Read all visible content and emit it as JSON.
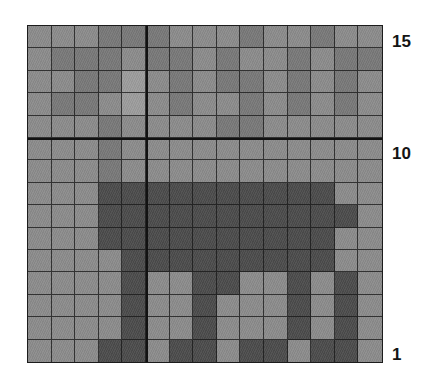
{
  "figure": {
    "caption": "",
    "background_color": "#ffffff"
  },
  "axis": {
    "y_ticks": [
      {
        "name": "ytick-15",
        "label": "15"
      },
      {
        "name": "ytick-10",
        "label": "10"
      },
      {
        "name": "ytick-1",
        "label": "1"
      }
    ]
  },
  "palette": {
    "light": "#9a9a9a",
    "mid": "#8a8a8a",
    "dark_mid": "#767676",
    "dark": "#4a4a4a",
    "gridline": "#191919",
    "border": "#1c1c1c",
    "tick_text": "#141414"
  },
  "chart_data": {
    "type": "heatmap",
    "title": "",
    "xlabel": "",
    "ylabel": "",
    "grid": true,
    "legend_position": "none",
    "rows": 15,
    "cols": 15,
    "xlim": [
      1,
      15
    ],
    "ylim": [
      1,
      15
    ],
    "x_tick_labels": [],
    "y_tick_labels": [
      "1",
      "10",
      "15"
    ],
    "y_tick_positions": [
      1,
      10,
      15
    ],
    "major_gridlines_every": 5,
    "value_levels": {
      "0": {
        "name": "light",
        "color": "#9c9c9c",
        "description": "background light gray"
      },
      "1": {
        "name": "mid",
        "color": "#8b8b8b",
        "description": "mid gray"
      },
      "2": {
        "name": "dark_mid",
        "color": "#787878",
        "description": "darker gray texture"
      },
      "3": {
        "name": "dark",
        "color": "#4b4b4b",
        "description": "object / animal silhouette"
      }
    },
    "comment": "Low-resolution 15x15 pixelated grayscale image of a quadruped animal (horse/cow) silhouette against a textured background. Rows listed top (row index 0 = y=15) to bottom (row index 14 = y=1). Each number is a value level key.",
    "values": [
      [
        1,
        1,
        1,
        2,
        2,
        2,
        1,
        1,
        1,
        2,
        1,
        1,
        2,
        1,
        1
      ],
      [
        1,
        2,
        2,
        2,
        1,
        2,
        2,
        1,
        2,
        1,
        1,
        2,
        1,
        2,
        2
      ],
      [
        1,
        1,
        2,
        2,
        0,
        1,
        2,
        1,
        2,
        2,
        1,
        2,
        1,
        2,
        1
      ],
      [
        1,
        2,
        2,
        1,
        0,
        1,
        2,
        1,
        1,
        2,
        1,
        2,
        1,
        2,
        1
      ],
      [
        1,
        1,
        1,
        2,
        1,
        1,
        1,
        1,
        2,
        2,
        1,
        1,
        1,
        1,
        1
      ],
      [
        1,
        1,
        1,
        2,
        1,
        1,
        1,
        1,
        1,
        1,
        1,
        1,
        1,
        1,
        1
      ],
      [
        1,
        1,
        1,
        2,
        1,
        1,
        1,
        1,
        1,
        1,
        1,
        1,
        1,
        1,
        1
      ],
      [
        1,
        1,
        1,
        3,
        3,
        3,
        3,
        3,
        3,
        3,
        3,
        3,
        3,
        1,
        1
      ],
      [
        1,
        1,
        1,
        3,
        3,
        3,
        3,
        3,
        3,
        3,
        3,
        3,
        3,
        3,
        1
      ],
      [
        1,
        1,
        1,
        3,
        3,
        3,
        3,
        3,
        3,
        3,
        3,
        3,
        3,
        1,
        1
      ],
      [
        1,
        1,
        1,
        1,
        3,
        3,
        3,
        3,
        3,
        3,
        3,
        3,
        3,
        1,
        1
      ],
      [
        1,
        1,
        1,
        1,
        3,
        1,
        1,
        3,
        3,
        1,
        1,
        3,
        1,
        3,
        1
      ],
      [
        1,
        1,
        1,
        1,
        3,
        1,
        1,
        3,
        1,
        1,
        1,
        3,
        1,
        3,
        1
      ],
      [
        1,
        1,
        1,
        1,
        3,
        1,
        1,
        3,
        1,
        1,
        1,
        3,
        1,
        3,
        1
      ],
      [
        1,
        1,
        1,
        3,
        3,
        1,
        3,
        3,
        1,
        3,
        3,
        1,
        3,
        3,
        1
      ]
    ]
  }
}
